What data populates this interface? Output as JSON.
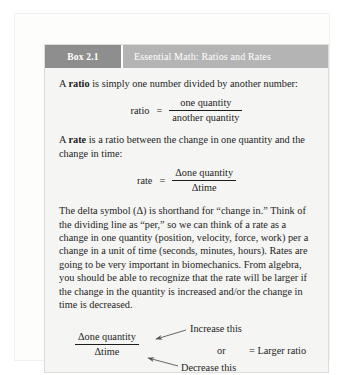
{
  "box": {
    "label": "Box 2.1",
    "title": "Essential Math: Ratios and Rates",
    "colors": {
      "label_background": "#8e8e8e",
      "title_background": "#b4b4b4",
      "body_background": "#f5f5f3",
      "text": "#1d1d1d"
    }
  },
  "content": {
    "ratio_intro_prefix": "A ",
    "ratio_intro_bold": "ratio",
    "ratio_intro_suffix": " is simply one number divided by another number:",
    "ratio_formula": {
      "lhs": "ratio",
      "equals": "=",
      "numerator": "one quantity",
      "denominator": "another quantity"
    },
    "rate_intro_prefix": "A ",
    "rate_intro_bold": "rate",
    "rate_intro_suffix": " is a ratio between the change in one quantity and the change in time:",
    "rate_formula": {
      "lhs": "rate",
      "equals": "=",
      "numerator": "Δone quantity",
      "denominator": "Δtime"
    },
    "explanation": "The delta symbol (Δ) is shorthand for “change in.” Think of the dividing line as “per,” so we can think of a rate as a change in one quantity (position, velocity, force, work) per a change in a unit of time (seconds, minutes, hours). Rates are going to be very important in biomechanics. From algebra, you should be able to recognize that the rate will be larger if the change in the quantity is increased and/or the change in time is decreased."
  },
  "diagram": {
    "numerator": "Δone quantity",
    "denominator": "Δtime",
    "note_increase": "Increase this",
    "note_decrease": "Decrease this",
    "or_label": "or",
    "result_label": "= Larger ratio",
    "arrow_color": "#555555"
  }
}
